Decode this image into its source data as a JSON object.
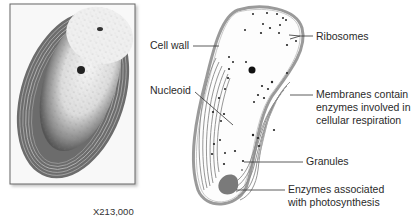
{
  "figure": {
    "micrograph": {
      "magnification": "X213,000"
    },
    "diagram": {
      "labels": {
        "cell_wall": "Cell wall",
        "nucleoid": "Nucleoid",
        "ribosomes": "Ribosomes",
        "membranes": [
          "Membranes contain",
          "enzymes involved in",
          "cellular respiration"
        ],
        "granules": "Granules",
        "enzymes_photo": [
          "Enzymes associated",
          "with photosynthesis"
        ]
      }
    },
    "colors": {
      "background": "#ffffff",
      "frame": "#666666",
      "cell_wall": "#9a9a9a",
      "cytoplasm": "#fdfdfd",
      "membrane": "#8a8a8a",
      "photo_enzyme": "#7a7a7a",
      "leader": "#333333"
    }
  }
}
